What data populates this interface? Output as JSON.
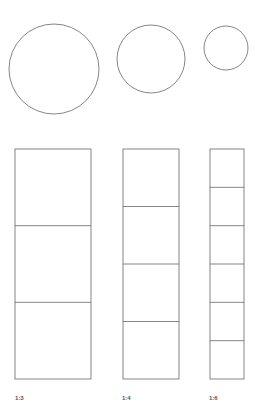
{
  "diagram": {
    "stroke_color": "#666666",
    "circles": [
      {
        "cx": 54,
        "cy": 69,
        "r": 45
      },
      {
        "cx": 151,
        "cy": 59,
        "r": 34
      },
      {
        "cx": 226,
        "cy": 48,
        "r": 22
      }
    ],
    "columns": [
      {
        "label": "1:3",
        "x": 15,
        "width": 76,
        "top": 149,
        "bottom": 379,
        "divisions": 3,
        "label_x": 15
      },
      {
        "label": "1:4",
        "x": 123,
        "width": 56,
        "top": 149,
        "bottom": 379,
        "divisions": 4,
        "label_x": 122
      },
      {
        "label": "1:6",
        "x": 210,
        "width": 34,
        "top": 149,
        "bottom": 379,
        "divisions": 6,
        "label_x": 209
      }
    ]
  }
}
